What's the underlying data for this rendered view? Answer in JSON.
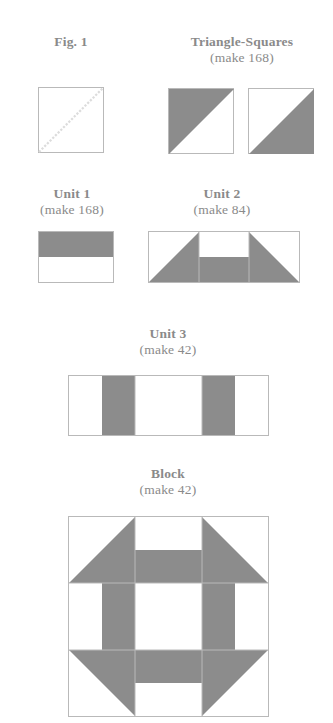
{
  "page": {
    "kind": "quilting-pattern-diagram",
    "background_color": "#ffffff",
    "fabric_gray": "#8c8c8c",
    "outline_color": "#b9b9b9",
    "text_color": "#8a8a8a",
    "dashed_line_color": "#dcdcdc"
  },
  "figures": [
    {
      "id": "fig-1",
      "title": "Fig. 1",
      "subtitle": "",
      "description": "white square with dashed diagonal line from lower-left to upper-right"
    },
    {
      "id": "triangle-squares",
      "title": "Triangle-Squares",
      "subtitle": "(make 168)",
      "description": "two squares, left gray upper-left triangle, right gray lower-right triangle"
    },
    {
      "id": "unit-1",
      "title": "Unit 1",
      "subtitle": "(make 168)",
      "description": "rectangle with gray top half and white bottom half"
    },
    {
      "id": "unit-2",
      "title": "Unit 2",
      "subtitle": "(make 84)",
      "description": "three cells wide: gray lower-right triangle, Unit 1, gray lower-left triangle"
    },
    {
      "id": "unit-3",
      "title": "Unit 3",
      "subtitle": "(make 42)",
      "description": "three cells wide: white with gray right half, white, white with gray left half"
    },
    {
      "id": "block",
      "title": "Block",
      "subtitle": "(make 42)",
      "description": "three by three grid built from Unit 2 top, Unit 3 rotated middle, Unit 2 flipped bottom"
    }
  ]
}
